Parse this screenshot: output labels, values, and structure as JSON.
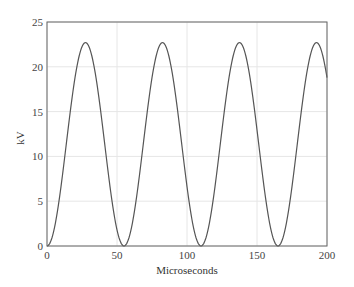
{
  "chart_data": {
    "type": "line",
    "title": "",
    "xlabel": "Microseconds",
    "ylabel": "kV",
    "xlim": [
      0,
      200
    ],
    "ylim": [
      0,
      25
    ],
    "xticks": [
      0,
      50,
      100,
      150,
      200
    ],
    "yticks": [
      0,
      5,
      10,
      15,
      20,
      25
    ],
    "grid": true,
    "legend": null,
    "series": [
      {
        "name": "voltage",
        "color": "#555555",
        "description": "Raised-cosine periodic waveform, period ~55 us, min 0 kV, max ~22.7 kV",
        "x": [
          0,
          10,
          20,
          27.5,
          35,
          45,
          55,
          65,
          75,
          82.5,
          90,
          100,
          110,
          120,
          130,
          137.5,
          145,
          155,
          165,
          175,
          185,
          192.5,
          200
        ],
        "values": [
          0,
          7.5,
          20.0,
          22.7,
          20.0,
          7.5,
          0,
          7.5,
          20.0,
          22.7,
          20.0,
          7.5,
          0,
          7.5,
          20.0,
          22.7,
          20.0,
          7.5,
          0,
          7.5,
          20.0,
          22.7,
          18.0
        ]
      }
    ],
    "model": {
      "amplitude_kv": 22.7,
      "period_us": 55
    }
  }
}
